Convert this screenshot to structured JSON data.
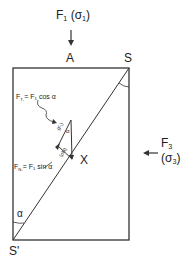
{
  "figure": {
    "top_force": {
      "label": "F",
      "sub": "1",
      "stress": "(σ",
      "stress_sub": "1",
      "stress_close": ")"
    },
    "side_force": {
      "label": "F",
      "sub": "3",
      "stress": "(σ",
      "stress_sub": "3",
      "stress_close": ")"
    },
    "point_A": "A",
    "point_S": "S",
    "point_S_prime": "S'",
    "point_X": "X",
    "angle_alpha": "α",
    "tangential_eq": {
      "lhs": "F",
      "lhs_sub": "T₁",
      "rhs": "= F₁ cos α"
    },
    "normal_eq": {
      "lhs": "F",
      "lhs_sub": "N₁",
      "rhs": "= F₁ sin α"
    },
    "triangle_label_upper": "(F₁)",
    "triangle_label_lower": "(σN)",
    "triangle_alpha": "α",
    "colors": {
      "line": "#333333",
      "background": "#ffffff"
    }
  }
}
